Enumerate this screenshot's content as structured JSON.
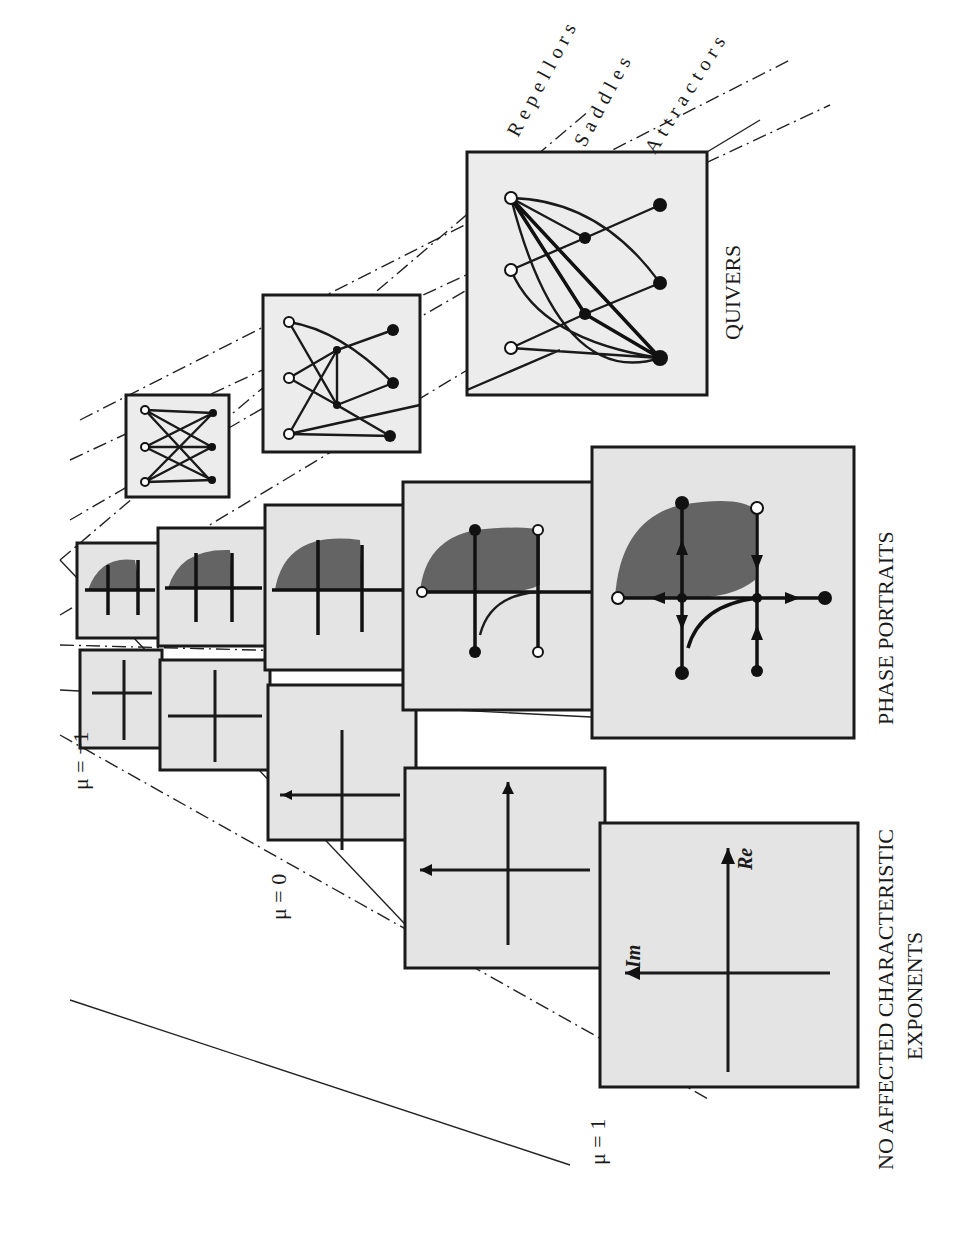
{
  "figure": {
    "orientation": "rotated-90-ccw",
    "row_labels": {
      "exponents_line1": "NO AFFECTED CHARACTERISTIC",
      "exponents_line2": "EXPONENTS",
      "phase_portraits": "PHASE  PORTRAITS",
      "quivers": "QUIVERS"
    },
    "parameter_labels": {
      "mu_1": "μ = 1",
      "mu_0": "μ = 0",
      "mu_neg1": "μ = −1"
    },
    "axis_labels": {
      "real": "Re",
      "imaginary": "Im"
    },
    "quiver_legend": {
      "repellors": "Repellors",
      "saddles": "Saddles",
      "attractors": "Attractors"
    },
    "quiver_node_types": {
      "repellor": "open circle",
      "saddle": "filled small circle",
      "attractor": "filled circle"
    },
    "colors": {
      "ink": "#1a1a1a",
      "panel_fill": "#e4e4e4",
      "background": "#ffffff"
    }
  }
}
